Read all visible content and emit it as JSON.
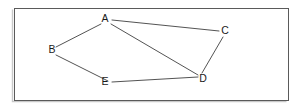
{
  "diagram": {
    "background_color": "#ffffff",
    "frame": {
      "name": "diagram-border",
      "x": 14,
      "y": 8,
      "width": 274,
      "height": 92,
      "stroke_color": "#5a5a5a",
      "fill_color": "#ffffff"
    },
    "style": {
      "edge_color": "#4a4a4a",
      "edge_width": 0.95,
      "label_color": "#1a1a1a",
      "label_font_size": 10.5
    },
    "nodes": [
      {
        "id": "A",
        "label": "A",
        "label_x": 105,
        "label_y": 19,
        "x": 110,
        "y": 22
      },
      {
        "id": "B",
        "label": "B",
        "label_x": 52,
        "label_y": 50,
        "x": 57,
        "y": 51
      },
      {
        "id": "C",
        "label": "C",
        "label_x": 225,
        "label_y": 31,
        "x": 220,
        "y": 34
      },
      {
        "id": "D",
        "label": "D",
        "label_x": 203,
        "label_y": 79,
        "x": 199,
        "y": 76
      },
      {
        "id": "E",
        "label": "E",
        "label_x": 105,
        "label_y": 82,
        "x": 111,
        "y": 83
      }
    ],
    "edges": [
      {
        "id": "A-C",
        "from": "A",
        "to": "C",
        "x1": 112,
        "y1": 20,
        "x2": 219,
        "y2": 31
      },
      {
        "id": "A-D",
        "from": "A",
        "to": "D",
        "x1": 111,
        "y1": 24,
        "x2": 198,
        "y2": 75
      },
      {
        "id": "A-B",
        "from": "A",
        "to": "B",
        "x1": 101,
        "y1": 24,
        "x2": 56,
        "y2": 47
      },
      {
        "id": "B-E",
        "from": "B",
        "to": "E",
        "x1": 56,
        "y1": 55,
        "x2": 108,
        "y2": 81
      },
      {
        "id": "E-D",
        "from": "E",
        "to": "D",
        "x1": 112,
        "y1": 82,
        "x2": 198,
        "y2": 77
      },
      {
        "id": "C-D",
        "from": "C",
        "to": "D",
        "x1": 223,
        "y1": 37,
        "x2": 202,
        "y2": 73
      }
    ]
  }
}
